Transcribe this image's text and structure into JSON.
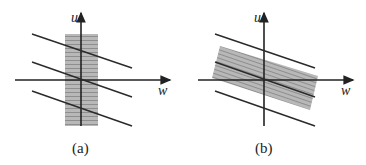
{
  "panels": [
    {
      "id": "a",
      "caption": "(a)",
      "x_axis_label": "w",
      "y_axis_label": "u",
      "region": "vertical rectangular band (hatched gray) centered on u-axis"
    },
    {
      "id": "b",
      "caption": "(b)",
      "x_axis_label": "w",
      "y_axis_label": "u",
      "region": "rotated rectangular band (hatched gray) aligned with parallel lines"
    }
  ],
  "colors": {
    "line": "#2a2a2a",
    "fill": "#b0b0b0",
    "hatch": "#909090"
  }
}
